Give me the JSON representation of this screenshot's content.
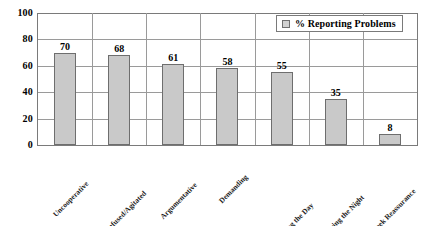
{
  "chart_data": {
    "type": "bar",
    "title": "",
    "subtitle": "",
    "xlabel": "",
    "ylabel": "",
    "ylim": [
      0,
      100
    ],
    "yticks": [
      0,
      20,
      40,
      60,
      80,
      100
    ],
    "grid": true,
    "legend_position": "top-right",
    "categories": [
      "Uncooperative",
      "Confused/Agitated",
      "Argumentative",
      "Demanding",
      "Wander During the Day",
      "Up During the Night",
      "Seek Reassurance"
    ],
    "series": [
      {
        "name": "% Reporting Problems",
        "color": "#c9c9c9",
        "values": [
          70,
          68,
          61,
          58,
          55,
          35,
          8
        ]
      }
    ],
    "data_labels": [
      "70",
      "68",
      "61",
      "58",
      "55",
      "35",
      "8"
    ]
  },
  "legend": {
    "label": "% Reporting Problems",
    "swatch_color": "#c9c9c9"
  },
  "axis": {
    "y_tick_labels": [
      "100",
      "80",
      "60",
      "40",
      "20",
      "0"
    ]
  }
}
